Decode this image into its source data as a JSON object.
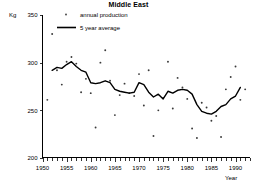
{
  "chart_data": {
    "type": "scatter",
    "title": "Middle East",
    "xlabel": "Year",
    "ylabel": "Kg",
    "xlim": [
      1950,
      1993
    ],
    "ylim": [
      200,
      350
    ],
    "grid": false,
    "legend_position": "top-center",
    "y_ticks": [
      200,
      250,
      300,
      350
    ],
    "x_ticks": [
      1950,
      1955,
      1960,
      1965,
      1970,
      1975,
      1980,
      1985,
      1990
    ],
    "x_minor_tick_interval": 1,
    "legend": [
      {
        "label": "annual production",
        "marker": "dot"
      },
      {
        "label": "5 year average",
        "marker": "line"
      }
    ],
    "series": [
      {
        "name": "annual production",
        "type": "scatter",
        "x": [
          1951,
          1952,
          1953,
          1954,
          1955,
          1956,
          1957,
          1958,
          1959,
          1960,
          1961,
          1962,
          1963,
          1964,
          1965,
          1966,
          1967,
          1968,
          1969,
          1970,
          1971,
          1972,
          1973,
          1974,
          1975,
          1976,
          1977,
          1978,
          1979,
          1980,
          1981,
          1982,
          1983,
          1984,
          1985,
          1986,
          1987,
          1988,
          1989,
          1990,
          1991,
          1992
        ],
        "values": [
          261,
          330,
          292,
          277,
          301,
          306,
          299,
          269,
          283,
          268,
          232,
          300,
          313,
          281,
          245,
          266,
          278,
          268,
          265,
          288,
          255,
          292,
          223,
          250,
          263,
          301,
          252,
          284,
          274,
          262,
          231,
          221,
          258,
          253,
          239,
          244,
          222,
          272,
          285,
          296,
          261,
          272
        ]
      },
      {
        "name": "5 year average",
        "type": "line",
        "x": [
          1952,
          1953,
          1954,
          1955,
          1956,
          1957,
          1958,
          1959,
          1960,
          1961,
          1962,
          1963,
          1964,
          1965,
          1966,
          1967,
          1968,
          1969,
          1970,
          1971,
          1972,
          1973,
          1974,
          1975,
          1976,
          1977,
          1978,
          1979,
          1980,
          1981,
          1982,
          1983,
          1984,
          1985,
          1986,
          1987,
          1988,
          1989,
          1990,
          1991
        ],
        "values": [
          292,
          295,
          294,
          298,
          301,
          296,
          292,
          290,
          279,
          278,
          279,
          281,
          279,
          272,
          270,
          269,
          268,
          269,
          279,
          277,
          269,
          264,
          267,
          262,
          270,
          268,
          271,
          272,
          271,
          267,
          256,
          249,
          247,
          246,
          249,
          254,
          256,
          262,
          265,
          274
        ]
      }
    ]
  }
}
